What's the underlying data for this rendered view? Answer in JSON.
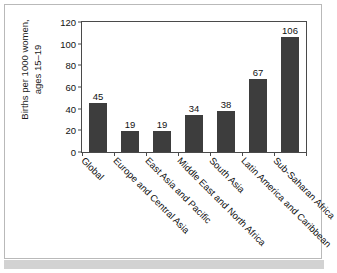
{
  "chart_data": {
    "type": "bar",
    "title": "",
    "xlabel": "",
    "ylabel": "Births per 1000 women, ages 15–19",
    "ylabel_lines": [
      "Births per 1000 women,",
      "ages 15–19"
    ],
    "categories": [
      "Global",
      "Europe and Central Asia",
      "East Asia and Pacific",
      "Middle East and North Africa",
      "South Asia",
      "Latin America and Caribbean",
      "Sub-Saharan Africa"
    ],
    "values": [
      45,
      19,
      19,
      34,
      38,
      67,
      106
    ],
    "value_labels": [
      "45",
      "19",
      "19",
      "34",
      "38",
      "67",
      "106"
    ],
    "ylim": [
      0,
      120
    ],
    "yticks": [
      0,
      20,
      40,
      60,
      80,
      100,
      120
    ],
    "ytick_labels": [
      "0",
      "20",
      "40",
      "60",
      "80",
      "100",
      "120"
    ],
    "grid": false,
    "legend": false,
    "legend_position": "none",
    "bar_color": "#3d3d3d",
    "axis_color": "#4a4a4a",
    "text_color": "#111111",
    "background_color": "#ffffff",
    "frame_border_color": "#b9b9b9",
    "footer_band_color": "#d2d2d2",
    "x_label_rotation_deg": 45
  }
}
